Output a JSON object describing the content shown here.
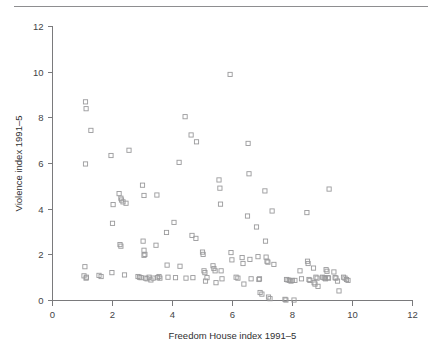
{
  "figure": {
    "background_color": "#ffffff",
    "marker_color": "#9a9a9c",
    "axis_color": "#7a7a7c",
    "rule_color": "#8e8e90"
  },
  "chart_data": {
    "type": "scatter",
    "title": "",
    "xlabel": "Freedom House index 1991–5",
    "ylabel": "Violence index 1991–5",
    "xlim": [
      0,
      12
    ],
    "ylim": [
      0,
      12
    ],
    "xticks": [
      0,
      2,
      4,
      6,
      8,
      10,
      12
    ],
    "yticks": [
      0,
      2,
      4,
      6,
      8,
      10,
      12
    ],
    "xticklabels": [
      "0",
      "2",
      "4",
      "6",
      "8",
      "10",
      "12"
    ],
    "yticklabels": [
      "0",
      "2",
      "4",
      "6",
      "8",
      "10",
      "12"
    ],
    "grid": false,
    "legend": null,
    "marker_style": "open-square",
    "points": [
      [
        1.1,
        8.7
      ],
      [
        1.12,
        8.4
      ],
      [
        1.28,
        7.45
      ],
      [
        1.1,
        5.98
      ],
      [
        1.08,
        1.48
      ],
      [
        1.05,
        1.08
      ],
      [
        1.12,
        0.98
      ],
      [
        1.13,
        1.02
      ],
      [
        1.55,
        1.1
      ],
      [
        1.62,
        1.05
      ],
      [
        1.95,
        6.35
      ],
      [
        2.02,
        4.2
      ],
      [
        2.0,
        3.38
      ],
      [
        1.98,
        1.22
      ],
      [
        2.22,
        4.68
      ],
      [
        2.28,
        4.48
      ],
      [
        2.3,
        4.4
      ],
      [
        2.35,
        4.32
      ],
      [
        2.25,
        2.45
      ],
      [
        2.28,
        2.38
      ],
      [
        2.45,
        4.26
      ],
      [
        2.55,
        6.58
      ],
      [
        2.4,
        1.12
      ],
      [
        2.85,
        1.05
      ],
      [
        2.9,
        1.02
      ],
      [
        2.95,
        1.0
      ],
      [
        3.0,
        5.05
      ],
      [
        3.02,
        2.6
      ],
      [
        3.05,
        2.2
      ],
      [
        3.08,
        2.02
      ],
      [
        3.05,
        1.98
      ],
      [
        3.1,
        0.98
      ],
      [
        3.15,
        0.95
      ],
      [
        3.22,
        1.02
      ],
      [
        3.05,
        4.6
      ],
      [
        3.28,
        0.9
      ],
      [
        3.35,
        0.98
      ],
      [
        3.48,
        4.62
      ],
      [
        3.45,
        2.42
      ],
      [
        3.5,
        1.0
      ],
      [
        3.55,
        1.05
      ],
      [
        3.58,
        0.98
      ],
      [
        3.8,
        2.98
      ],
      [
        3.82,
        1.55
      ],
      [
        3.85,
        1.02
      ],
      [
        4.05,
        3.42
      ],
      [
        4.1,
        1.0
      ],
      [
        4.22,
        6.05
      ],
      [
        4.25,
        1.5
      ],
      [
        4.42,
        8.05
      ],
      [
        4.45,
        0.98
      ],
      [
        4.62,
        7.25
      ],
      [
        4.65,
        2.85
      ],
      [
        4.68,
        1.0
      ],
      [
        4.78,
        2.72
      ],
      [
        4.8,
        6.95
      ],
      [
        5.0,
        2.12
      ],
      [
        5.02,
        2.02
      ],
      [
        5.05,
        1.3
      ],
      [
        5.08,
        1.22
      ],
      [
        5.1,
        0.85
      ],
      [
        5.15,
        1.0
      ],
      [
        5.35,
        1.52
      ],
      [
        5.38,
        1.4
      ],
      [
        5.42,
        1.3
      ],
      [
        5.45,
        0.78
      ],
      [
        5.55,
        5.28
      ],
      [
        5.58,
        4.92
      ],
      [
        5.6,
        4.22
      ],
      [
        5.62,
        1.3
      ],
      [
        5.65,
        0.95
      ],
      [
        5.92,
        9.9
      ],
      [
        5.95,
        2.1
      ],
      [
        5.98,
        1.78
      ],
      [
        6.12,
        1.02
      ],
      [
        6.18,
        0.98
      ],
      [
        6.32,
        1.88
      ],
      [
        6.35,
        1.62
      ],
      [
        6.38,
        0.72
      ],
      [
        6.52,
        6.88
      ],
      [
        6.55,
        5.55
      ],
      [
        6.5,
        3.7
      ],
      [
        6.58,
        1.8
      ],
      [
        6.62,
        0.95
      ],
      [
        6.8,
        3.22
      ],
      [
        6.85,
        1.92
      ],
      [
        6.88,
        0.92
      ],
      [
        6.9,
        0.95
      ],
      [
        6.92,
        0.35
      ],
      [
        6.98,
        0.28
      ],
      [
        7.08,
        4.8
      ],
      [
        7.1,
        2.6
      ],
      [
        7.12,
        1.9
      ],
      [
        7.15,
        1.72
      ],
      [
        7.18,
        1.68
      ],
      [
        7.2,
        0.15
      ],
      [
        7.25,
        0.08
      ],
      [
        7.32,
        3.92
      ],
      [
        7.38,
        1.58
      ],
      [
        7.75,
        0.05
      ],
      [
        7.78,
        0.02
      ],
      [
        7.8,
        0.92
      ],
      [
        7.85,
        0.9
      ],
      [
        7.9,
        0.88
      ],
      [
        7.95,
        0.85
      ],
      [
        8.0,
        0.88
      ],
      [
        8.05,
        0.02
      ],
      [
        8.08,
        0.88
      ],
      [
        8.25,
        1.3
      ],
      [
        8.3,
        0.95
      ],
      [
        8.48,
        3.85
      ],
      [
        8.5,
        1.72
      ],
      [
        8.52,
        1.62
      ],
      [
        8.55,
        0.92
      ],
      [
        8.58,
        0.88
      ],
      [
        8.7,
        1.42
      ],
      [
        8.72,
        0.78
      ],
      [
        8.75,
        0.72
      ],
      [
        8.78,
        1.02
      ],
      [
        8.82,
        0.98
      ],
      [
        8.85,
        0.62
      ],
      [
        9.0,
        1.02
      ],
      [
        9.05,
        1.0
      ],
      [
        9.08,
        0.98
      ],
      [
        9.1,
        0.95
      ],
      [
        9.12,
        1.35
      ],
      [
        9.15,
        1.28
      ],
      [
        9.18,
        1.0
      ],
      [
        9.2,
        0.98
      ],
      [
        9.22,
        4.88
      ],
      [
        9.38,
        1.25
      ],
      [
        9.42,
        1.0
      ],
      [
        9.45,
        0.98
      ],
      [
        9.5,
        0.85
      ],
      [
        9.55,
        0.42
      ],
      [
        9.7,
        1.02
      ],
      [
        9.75,
        0.98
      ],
      [
        9.8,
        0.92
      ],
      [
        9.85,
        0.88
      ]
    ]
  }
}
